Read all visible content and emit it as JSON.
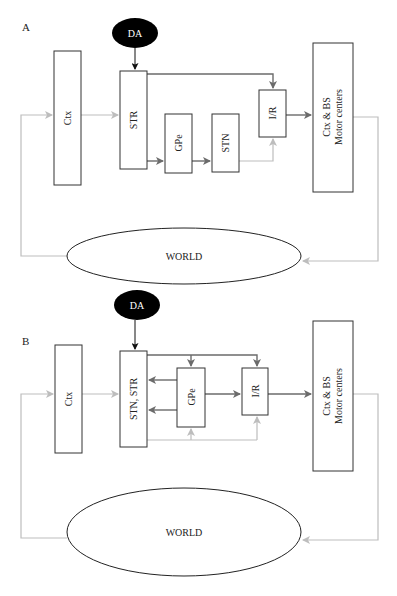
{
  "figure": {
    "panels": [
      {
        "label": "A",
        "nodes": {
          "da": "DA",
          "ctx": "Ctx",
          "str": "STR",
          "gpe": "GPe",
          "stn": "STN",
          "ir": "I/R",
          "motor_line1": "Ctx & BS",
          "motor_line2": "Motor centers",
          "world": "WORLD"
        }
      },
      {
        "label": "B",
        "nodes": {
          "da": "DA",
          "ctx": "Ctx",
          "stnstr": "STN, STR",
          "gpe": "GPe",
          "ir": "I/R",
          "motor_line1": "Ctx & BS",
          "motor_line2": "Motor centers",
          "world": "WORLD"
        }
      }
    ],
    "colors": {
      "dark_arrow": "#6b6b6b",
      "light_arrow": "#bdbdbd",
      "da_fill": "#000000",
      "box_stroke": "#333333"
    }
  }
}
